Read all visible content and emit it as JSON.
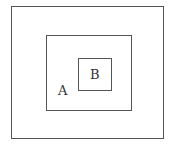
{
  "diagram": {
    "type": "nested-sets",
    "colors": {
      "stroke": "#555555",
      "text": "#333333",
      "background": "#ffffff"
    },
    "boxes": [
      {
        "id": "outer",
        "label": ""
      },
      {
        "id": "A",
        "label": "A"
      },
      {
        "id": "B",
        "label": "B"
      }
    ],
    "labels": {
      "A": "A",
      "B": "B"
    }
  }
}
